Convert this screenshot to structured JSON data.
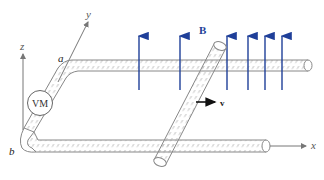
{
  "diagram": {
    "labels": {
      "z_axis": "z",
      "y_axis": "y",
      "x_axis": "x",
      "point_a": "a",
      "point_b": "b",
      "field": "B",
      "velocity": "v",
      "voltmeter": "VM"
    },
    "colors": {
      "field_arrows": "#1f3f99",
      "rails_outline": "#888888",
      "axes": "#777777",
      "velocity_arrow": "#111111"
    },
    "field_arrow_count": 6
  }
}
